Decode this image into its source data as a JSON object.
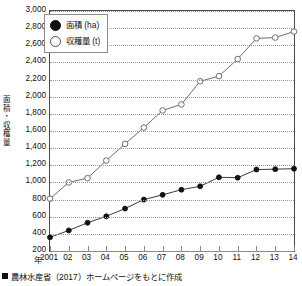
{
  "chart_data": {
    "type": "line",
    "title": "",
    "xlabel": "年",
    "ylabel": "面積・収穫量",
    "ylabel_chars": [
      "面",
      "積",
      "・",
      "収",
      "穫",
      "量"
    ],
    "x": [
      2001,
      2002,
      2003,
      2004,
      2005,
      2006,
      2007,
      2008,
      2009,
      2010,
      2011,
      2012,
      2013,
      2014
    ],
    "categories": [
      "2001",
      "02",
      "03",
      "04",
      "05",
      "06",
      "07",
      "08",
      "09",
      "10",
      "11",
      "12",
      "13",
      "14"
    ],
    "xlim": [
      2001,
      2014
    ],
    "ylim": [
      200,
      3000
    ],
    "yticks": [
      200,
      400,
      600,
      800,
      1000,
      1200,
      1400,
      1600,
      1800,
      2000,
      2200,
      2400,
      2600,
      2800,
      3000
    ],
    "ytick_labels": [
      "200",
      "400",
      "600",
      "800",
      "1,000",
      "1,200",
      "1,400",
      "1,600",
      "1,800",
      "2,000",
      "2,200",
      "2,400",
      "2,600",
      "2,800",
      "3,000"
    ],
    "grid": true,
    "legend_position": "top-left",
    "series": [
      {
        "name": "面積 (ha)",
        "marker": "filled-circle",
        "color": "#111111",
        "values": [
          360,
          440,
          530,
          605,
          695,
          800,
          855,
          915,
          955,
          1060,
          1055,
          1150,
          1155,
          1160
        ]
      },
      {
        "name": "収穫量 (t)",
        "marker": "open-circle",
        "color": "#6d6d6d",
        "values": [
          810,
          1000,
          1050,
          1255,
          1450,
          1640,
          1840,
          1910,
          2180,
          2240,
          2440,
          2680,
          2690,
          2760
        ]
      }
    ]
  },
  "legend": {
    "items": [
      {
        "label": "面積 (ha)",
        "marker": "filled-circle"
      },
      {
        "label": "収穫量 (t)",
        "marker": "open-circle"
      }
    ]
  },
  "axis": {
    "x_unit_label": "年",
    "y_title": "面積・収穫量"
  },
  "caption": {
    "text": "農林水産省（2017）ホームページをもとに作成"
  }
}
